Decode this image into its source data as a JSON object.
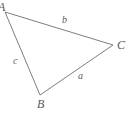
{
  "figure": {
    "kind": "geometry-triangle-diagram",
    "background_color": "#ffffff",
    "stroke_color": "#7d7d7d",
    "label_color": "#5a5a5a",
    "stroke_width": 1
  },
  "vertices": [
    {
      "id": "A",
      "label": "A",
      "x": 5,
      "y": 12,
      "label_x": -2,
      "label_y": 1,
      "clipped": true
    },
    {
      "id": "B",
      "label": "B",
      "x": 40,
      "y": 95,
      "label_x": 37,
      "label_y": 98,
      "clipped": false
    },
    {
      "id": "C",
      "label": "C",
      "x": 113,
      "y": 45,
      "label_x": 117,
      "label_y": 39,
      "clipped": false
    }
  ],
  "sides": [
    {
      "id": "a",
      "label": "a",
      "from": "B",
      "to": "C",
      "label_x": 78,
      "label_y": 71
    },
    {
      "id": "b",
      "label": "b",
      "from": "A",
      "to": "C",
      "label_x": 62,
      "label_y": 15
    },
    {
      "id": "c",
      "label": "c",
      "from": "A",
      "to": "B",
      "label_x": 13,
      "label_y": 56
    }
  ],
  "chart_data": {
    "type": "diagram",
    "title": "",
    "shape": "triangle",
    "points": {
      "A": [
        5,
        12
      ],
      "B": [
        40,
        95
      ],
      "C": [
        113,
        45
      ]
    },
    "edges": [
      {
        "name": "b",
        "endpoints": [
          "A",
          "C"
        ]
      },
      {
        "name": "a",
        "endpoints": [
          "B",
          "C"
        ]
      },
      {
        "name": "c",
        "endpoints": [
          "A",
          "B"
        ]
      }
    ],
    "vertex_labels": [
      "A",
      "B",
      "C"
    ],
    "edge_labels": [
      "a",
      "b",
      "c"
    ],
    "xlim": [
      0,
      130
    ],
    "ylim": [
      0,
      115
    ],
    "grid": false,
    "legend": "none"
  }
}
